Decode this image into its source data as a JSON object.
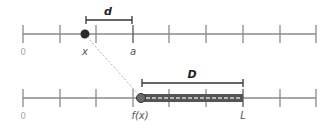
{
  "diagram": {
    "type": "number-line-mapping",
    "colors": {
      "axis": "#8a8a8a",
      "point": "#2b2b2b",
      "bar": "#555555",
      "bar_dash": "#d9d9d9",
      "bracket": "#333333",
      "connector": "#b0b0b0"
    },
    "top_line": {
      "start_label": "0",
      "point_label": "x",
      "end_tick_label": "a",
      "distance_label": "d"
    },
    "bottom_line": {
      "start_label": "0",
      "point_label": "f(x)",
      "end_tick_label": "L",
      "distance_label": "D"
    }
  }
}
